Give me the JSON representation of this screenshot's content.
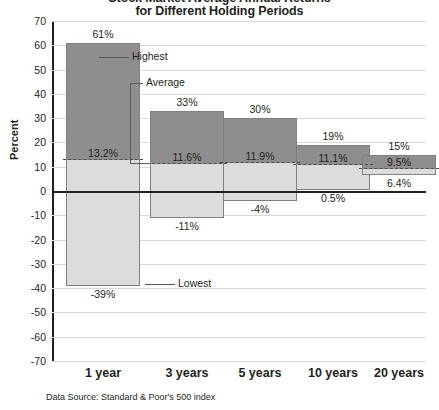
{
  "chart_data": {
    "type": "bar",
    "title": "Stock Market Average Annual Returns",
    "subtitle": "for Different Holding Periods",
    "xlabel": "",
    "ylabel": "Percent",
    "ylim": [
      -70,
      70
    ],
    "ytick_step": 10,
    "grid": true,
    "legend": "none",
    "source": "Data Source: Standard & Poor's 500 index",
    "categories": [
      "1 year",
      "3 years",
      "5 years",
      "10 years",
      "20 years"
    ],
    "series": [
      {
        "name": "Highest",
        "values": [
          61,
          33,
          30,
          19,
          15
        ]
      },
      {
        "name": "Average",
        "values": [
          13.2,
          11.6,
          11.9,
          11.1,
          9.5
        ]
      },
      {
        "name": "Lowest",
        "values": [
          -39,
          -11,
          -4,
          0.5,
          6.4
        ]
      }
    ],
    "bars": [
      {
        "category": "1 year",
        "high": 61,
        "average": 13.2,
        "low": -39,
        "high_label": "61%",
        "avg_label": "13.2%",
        "low_label": "-39%"
      },
      {
        "category": "3 years",
        "high": 33,
        "average": 11.6,
        "low": -11,
        "high_label": "33%",
        "avg_label": "11.6%",
        "low_label": "-11%"
      },
      {
        "category": "5 years",
        "high": 30,
        "average": 11.9,
        "low": -4,
        "high_label": "30%",
        "avg_label": "11.9%",
        "low_label": "-4%"
      },
      {
        "category": "10 years",
        "high": 19,
        "average": 11.1,
        "low": 0.5,
        "high_label": "19%",
        "avg_label": "11.1%",
        "low_label": "0.5%"
      },
      {
        "category": "20 years",
        "high": 15,
        "average": 9.5,
        "low": 6.4,
        "high_label": "15%",
        "avg_label": "9.5%",
        "low_label": "6.4%"
      }
    ],
    "ytick_labels": [
      "70",
      "60",
      "50",
      "40",
      "30",
      "20",
      "10",
      "0",
      "-10",
      "-20",
      "-30",
      "-40",
      "-50",
      "-60",
      "-70"
    ],
    "annotations": [
      {
        "name": "highest",
        "text": "Highest"
      },
      {
        "name": "average",
        "text": "Average"
      },
      {
        "name": "lowest",
        "text": "Lowest"
      }
    ],
    "colors": {
      "bar_upper": "#8e8e8e",
      "bar_lower": "#dcdcdc",
      "bar_border": "#808080",
      "gridline": "#d9d9d9",
      "axis": "#231f20",
      "text": "#231f20"
    }
  }
}
